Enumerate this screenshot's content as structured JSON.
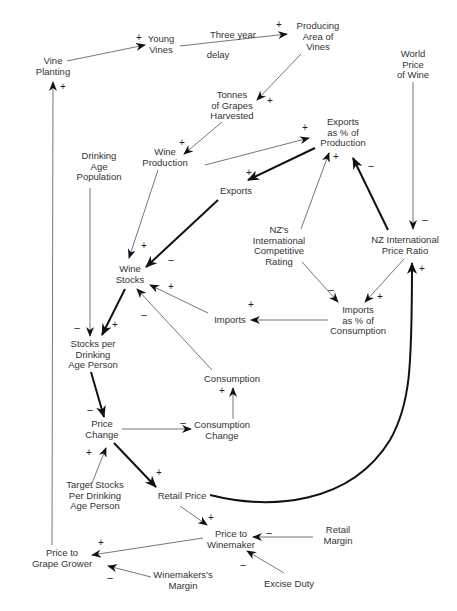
{
  "nodes": {
    "vine_planting": "Vine\nPlanting",
    "young_vines": "Young\nVines",
    "three_year": "Three year",
    "delay": "delay",
    "producing_area": "Producing\nArea of\nVines",
    "world_price": "World\nPrice\nof Wine",
    "tonnes_grapes": "Tonnes\nof Grapes\nHarvested",
    "wine_production": "Wine\nProduction",
    "exports_pct": "Exports\nas % of\nProduction",
    "drinking_age_pop": "Drinking\nAge\nPopulation",
    "exports": "Exports",
    "nz_competitive": "NZ's\nInternational\nCompetitive\nRating",
    "nz_price_ratio": "NZ International\nPrice Ratio",
    "wine_stocks": "Wine\nStocks",
    "imports": "Imports",
    "imports_pct": "Imports\nas % of\nConsumption",
    "stocks_per_person": "Stocks per\nDrinking\nAge Person",
    "consumption": "Consumption",
    "price_change": "Price\nChange",
    "consumption_change": "Consumption\nChange",
    "target_stocks": "Target Stocks\nPer Drinking\nAge Person",
    "retail_price": "Retail Price",
    "price_to_winemaker": "Price to\nWinemaker",
    "retail_margin": "Retail\nMargin",
    "price_to_grower": "Price to\nGrape Grower",
    "winemakers_margin": "Winemakers's\nMargin",
    "excise_duty": "Excise Duty"
  },
  "signs": {
    "plus": "+",
    "minus": "–"
  },
  "colors": {
    "text": "#333333",
    "thin_link": "#777777",
    "thick_link": "#111111"
  }
}
